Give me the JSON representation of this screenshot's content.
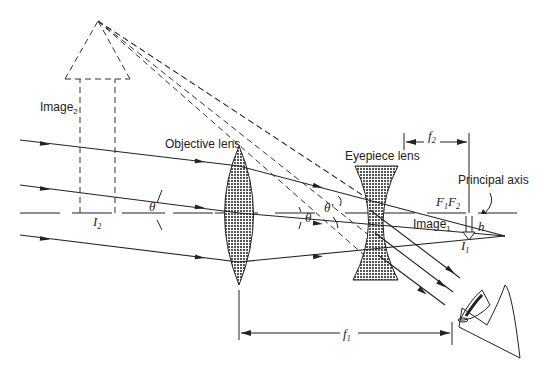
{
  "diagram": {
    "type": "Galilean telescope ray diagram",
    "labels": {
      "image2": "Image",
      "image2_sub": "2",
      "objective_lens": "Objective lens",
      "eyepiece_lens": "Eyepiece lens",
      "principal_axis": "Principal axis",
      "image1": "Image",
      "image1_sub": "1",
      "f1": "f",
      "f1_sub": "1",
      "f2": "f",
      "f2_sub": "2",
      "F1": "F",
      "F1_sub": "1",
      "F2": "F",
      "F2_sub": "2",
      "h": "h",
      "I1": "I",
      "I1_sub": "1",
      "I2": "I",
      "I2_sub": "2",
      "theta": "θ",
      "theta_near_eyepiece": "θ",
      "theta_prime": "θ'"
    },
    "colors": {
      "line": "#222222",
      "background": "#ffffff"
    }
  }
}
